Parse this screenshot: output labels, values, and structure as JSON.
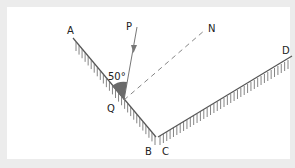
{
  "diagram": {
    "type": "plane-mirror-reflection",
    "labels": {
      "A": "A",
      "B": "B",
      "C": "C",
      "D": "D",
      "P": "P",
      "N": "N",
      "Q": "Q",
      "angle": "50°"
    },
    "colors": {
      "background": "#ececec",
      "panel": "#ffffff",
      "line": "#555555",
      "angle_fill": "#666666",
      "dashed": "#777777"
    }
  }
}
